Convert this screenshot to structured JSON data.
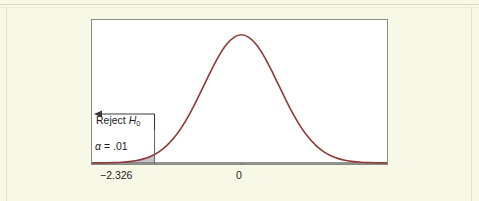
{
  "figure": {
    "background_color": "#f8f8e6",
    "plot_background_color": "#ffffff",
    "frame_color": "#8a8a86",
    "curve_color": "#8c3a36",
    "shade_color": "#b8b8b8",
    "text_color": "#1d1d1d"
  },
  "annotations": {
    "reject_prefix": "Reject ",
    "reject_var": "H",
    "reject_sub": "0",
    "alpha_text": "α = .01",
    "alpha_symbol": "α",
    "alpha_value": ".01"
  },
  "axis": {
    "tick_labels": [
      "−2.326",
      "0"
    ],
    "tick_values": [
      -2.326,
      0
    ]
  },
  "chart_data": {
    "type": "line",
    "title": "",
    "subtitle": "",
    "xlabel": "",
    "ylabel": "",
    "grid": false,
    "legend": "none",
    "distribution": "standard normal",
    "mean": 0,
    "sd": 1,
    "xlim": [
      -4.0,
      3.9
    ],
    "ylim": [
      0,
      0.42
    ],
    "x_tick_labels": [
      "−2.326",
      "0"
    ],
    "x_ticks": [
      -2.326,
      0
    ],
    "critical_value": -2.326,
    "alpha": 0.01,
    "tail": "left",
    "shaded_region": {
      "label": "Reject H0",
      "from": -4.0,
      "to": -2.326,
      "area": 0.01
    },
    "x": [
      -4.0,
      -3.8,
      -3.6,
      -3.4,
      -3.2,
      -3.0,
      -2.8,
      -2.6,
      -2.4,
      -2.326,
      -2.2,
      -2.0,
      -1.8,
      -1.6,
      -1.4,
      -1.2,
      -1.0,
      -0.8,
      -0.6,
      -0.4,
      -0.2,
      0.0,
      0.2,
      0.4,
      0.6,
      0.8,
      1.0,
      1.2,
      1.4,
      1.6,
      1.8,
      2.0,
      2.2,
      2.4,
      2.6,
      2.8,
      3.0,
      3.2,
      3.4,
      3.6,
      3.9
    ],
    "y": [
      0.0001,
      0.0003,
      0.0006,
      0.0012,
      0.0024,
      0.0044,
      0.0079,
      0.0136,
      0.0224,
      0.0267,
      0.0355,
      0.054,
      0.079,
      0.1109,
      0.1497,
      0.1942,
      0.242,
      0.2897,
      0.3332,
      0.3683,
      0.391,
      0.3989,
      0.391,
      0.3683,
      0.3332,
      0.2897,
      0.242,
      0.1942,
      0.1497,
      0.1109,
      0.079,
      0.054,
      0.0355,
      0.0224,
      0.0136,
      0.0079,
      0.0044,
      0.0024,
      0.0012,
      0.0006,
      0.0002
    ]
  }
}
